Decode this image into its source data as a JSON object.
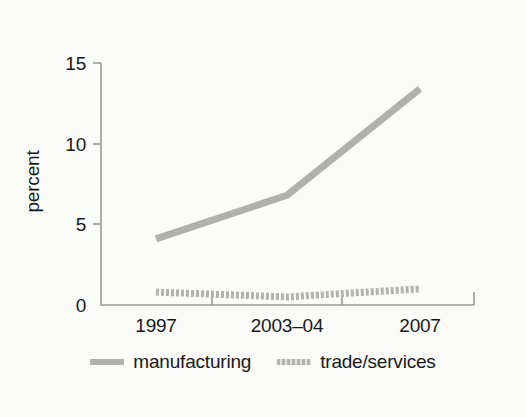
{
  "chart_data": {
    "type": "line",
    "title": "",
    "subtitle": "",
    "xlabel": "",
    "ylabel": "percent",
    "categories": [
      "1997",
      "2003–04",
      "2007"
    ],
    "series": [
      {
        "name": "manufacturing",
        "values": [
          4.1,
          6.8,
          13.4
        ],
        "color": "#b0b0b0",
        "style": "solid"
      },
      {
        "name": "trade/services",
        "values": [
          0.8,
          0.5,
          1.0
        ],
        "color": "#b2b2b2",
        "style": "dotted"
      }
    ],
    "ylim": [
      0,
      15
    ],
    "yticks": [
      0,
      5,
      10,
      15
    ],
    "ytick_labels": [
      "0",
      "5",
      "10",
      "15"
    ],
    "xtick_labels": [
      "1997",
      "2003–04",
      "2007"
    ],
    "grid": false,
    "legend_position": "bottom"
  },
  "axes": {
    "y_title": "percent",
    "y_ticks": [
      {
        "label": "15",
        "value": 15
      },
      {
        "label": "10",
        "value": 10
      },
      {
        "label": "5",
        "value": 5
      },
      {
        "label": "0",
        "value": 0
      }
    ],
    "x_ticks": [
      {
        "label": "1997"
      },
      {
        "label": "2003–04"
      },
      {
        "label": "2007"
      }
    ]
  },
  "legend": {
    "items": [
      {
        "label": "manufacturing",
        "swatch": "solid-line-swatch"
      },
      {
        "label": "trade/services",
        "swatch": "dotted-line-swatch"
      }
    ]
  },
  "colors": {
    "background": "#fbfbfa",
    "axis": "#9a9a9a",
    "text": "#181818",
    "series_manufacturing": "#b0b0b0",
    "series_trade_services": "#b2b2b2"
  }
}
